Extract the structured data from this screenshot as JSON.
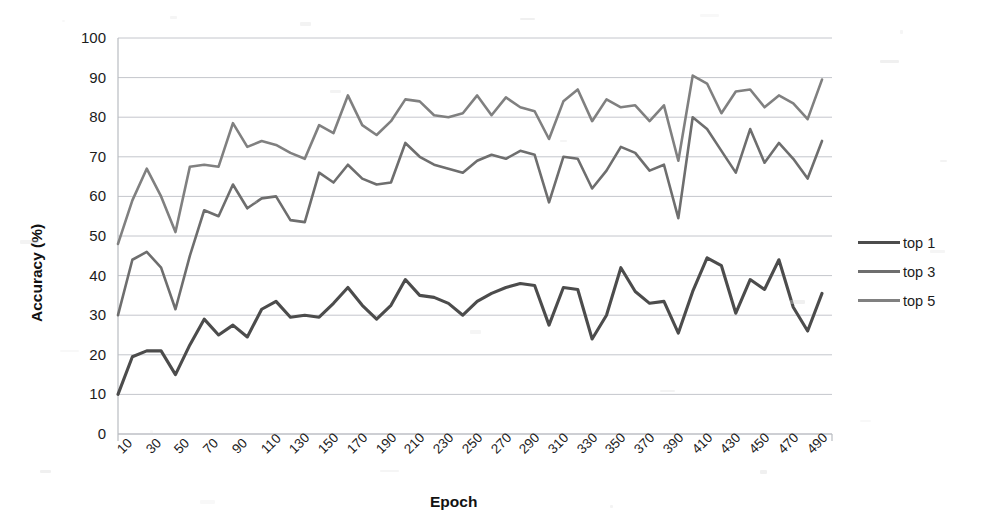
{
  "chart_data": {
    "type": "line",
    "title": "",
    "xlabel": "Epoch",
    "ylabel": "Accuracy (%)",
    "xlim": [
      0,
      50
    ],
    "ylim": [
      0,
      100
    ],
    "ytick_values": [
      0,
      10,
      20,
      30,
      40,
      50,
      60,
      70,
      80,
      90,
      100
    ],
    "ytick_labels": [
      "0",
      "10",
      "20",
      "30",
      "40",
      "50",
      "60",
      "70",
      "80",
      "90",
      "100"
    ],
    "grid": "horizontal",
    "legend_position": "right",
    "legend_entries": [
      "top 1",
      "top 3",
      "top 5"
    ],
    "x": [
      10,
      20,
      30,
      40,
      50,
      60,
      70,
      80,
      90,
      100,
      110,
      120,
      130,
      140,
      150,
      160,
      170,
      180,
      190,
      200,
      210,
      220,
      230,
      240,
      250,
      260,
      270,
      280,
      290,
      300,
      310,
      320,
      330,
      340,
      350,
      360,
      370,
      380,
      390,
      400,
      410,
      420,
      430,
      440,
      450,
      460,
      470,
      480,
      490,
      500
    ],
    "xtick_labels": [
      "10",
      "30",
      "50",
      "70",
      "90",
      "110",
      "130",
      "150",
      "170",
      "190",
      "210",
      "230",
      "250",
      "270",
      "290",
      "310",
      "330",
      "350",
      "370",
      "390",
      "410",
      "430",
      "450",
      "470",
      "490"
    ],
    "series": [
      {
        "name": "top 1",
        "color": "#4c4c4c",
        "values": [
          10.0,
          19.5,
          21.0,
          21.0,
          15.0,
          22.5,
          29.0,
          25.0,
          27.5,
          24.5,
          31.5,
          33.5,
          29.5,
          30.0,
          29.5,
          33.0,
          37.0,
          32.5,
          29.0,
          32.5,
          39.0,
          35.0,
          34.5,
          33.0,
          30.0,
          33.5,
          35.5,
          37.0,
          38.0,
          37.5,
          27.5,
          37.0,
          36.5,
          24.0,
          30.0,
          42.0,
          36.0,
          33.0,
          33.5,
          25.5,
          36.0,
          44.5,
          42.5,
          30.5,
          39.0,
          36.5,
          44.0,
          32.0,
          26.0,
          35.5
        ]
      },
      {
        "name": "top 3",
        "color": "#6e6e6e",
        "values": [
          30.0,
          44.0,
          46.0,
          42.0,
          31.5,
          45.0,
          56.5,
          55.0,
          63.0,
          57.0,
          59.5,
          60.0,
          54.0,
          53.5,
          66.0,
          63.5,
          68.0,
          64.5,
          63.0,
          63.5,
          73.5,
          70.0,
          68.0,
          67.0,
          66.0,
          69.0,
          70.5,
          69.5,
          71.5,
          70.5,
          58.5,
          70.0,
          69.5,
          62.0,
          66.5,
          72.5,
          71.0,
          66.5,
          68.0,
          54.5,
          80.0,
          77.0,
          71.5,
          66.0,
          77.0,
          68.5,
          73.5,
          69.5,
          64.5,
          74.0
        ]
      },
      {
        "name": "top 5",
        "color": "#808080",
        "values": [
          48.0,
          59.0,
          67.0,
          60.0,
          51.0,
          67.5,
          68.0,
          67.5,
          78.5,
          72.5,
          74.0,
          73.0,
          71.0,
          69.5,
          78.0,
          76.0,
          85.5,
          78.0,
          75.5,
          79.0,
          84.5,
          84.0,
          80.5,
          80.0,
          81.0,
          85.5,
          80.5,
          85.0,
          82.5,
          81.5,
          74.5,
          84.0,
          87.0,
          79.0,
          84.5,
          82.5,
          83.0,
          79.0,
          83.0,
          69.0,
          90.5,
          88.5,
          81.0,
          86.5,
          87.0,
          82.5,
          85.5,
          83.5,
          79.5,
          89.5
        ]
      }
    ]
  },
  "legend": {
    "items": [
      {
        "label": "top 1",
        "color": "#4c4c4c"
      },
      {
        "label": "top 3",
        "color": "#6e6e6e"
      },
      {
        "label": "top 5",
        "color": "#808080"
      }
    ]
  },
  "axes": {
    "x_title": "Epoch",
    "y_title": "Accuracy (%)"
  }
}
